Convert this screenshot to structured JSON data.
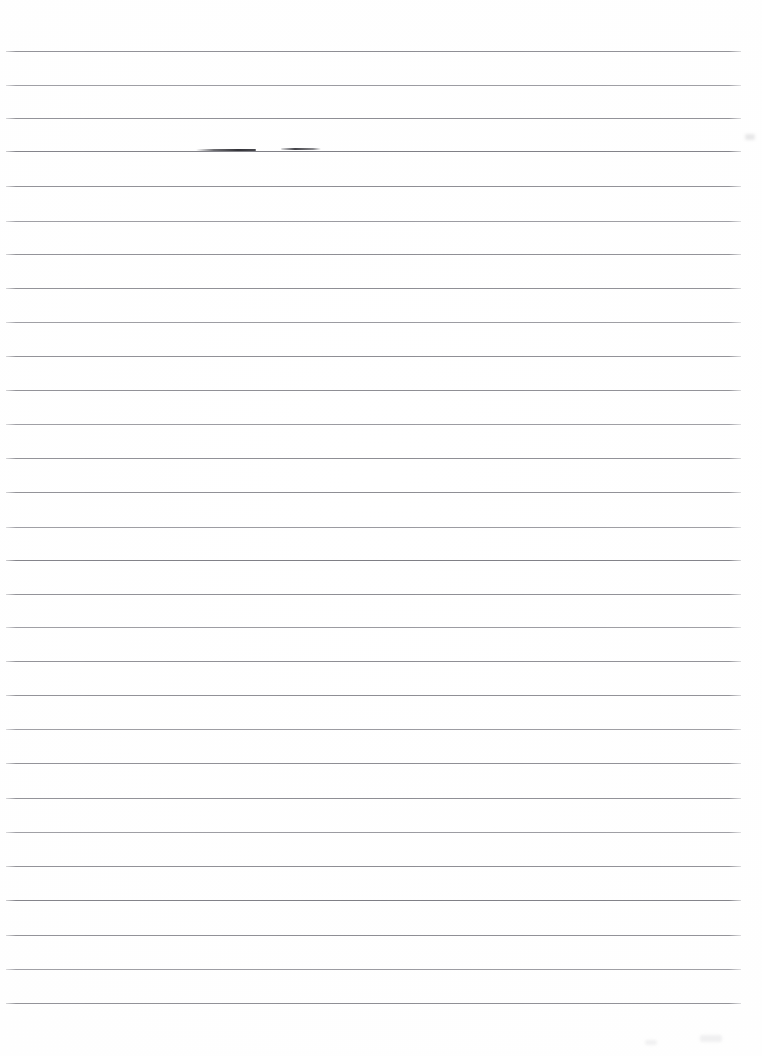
{
  "document": {
    "kind": "scanned-ruled-paper",
    "title": "Blank lined notebook page (scan)",
    "page_width": 762,
    "page_height": 1056,
    "orientation": "portrait",
    "background_color": "#fefefe",
    "rule_color": "#8e8e94",
    "ink_color": "#2e2e34",
    "visible_text": "",
    "content_note": "No text or writing is present on the page."
  },
  "ruling": {
    "line_count": 29,
    "first_line_y": 51,
    "spacing_px": 33.8,
    "left_margin_x": 6,
    "right_edge_x": 741,
    "has_vertical_margin_rule": false,
    "has_page_border": false,
    "lines": [
      {
        "y": 51,
        "x1": 6,
        "x2": 741,
        "weight": "normal"
      },
      {
        "y": 85,
        "x1": 6,
        "x2": 741,
        "weight": "soft"
      },
      {
        "y": 118,
        "x1": 6,
        "x2": 741,
        "weight": "normal"
      },
      {
        "y": 151,
        "x1": 6,
        "x2": 741,
        "weight": "dark"
      },
      {
        "y": 186,
        "x1": 6,
        "x2": 741,
        "weight": "normal"
      },
      {
        "y": 221,
        "x1": 6,
        "x2": 741,
        "weight": "soft"
      },
      {
        "y": 254,
        "x1": 6,
        "x2": 741,
        "weight": "normal"
      },
      {
        "y": 288,
        "x1": 6,
        "x2": 741,
        "weight": "normal"
      },
      {
        "y": 322,
        "x1": 6,
        "x2": 741,
        "weight": "soft"
      },
      {
        "y": 356,
        "x1": 6,
        "x2": 741,
        "weight": "normal"
      },
      {
        "y": 390,
        "x1": 6,
        "x2": 741,
        "weight": "normal"
      },
      {
        "y": 424,
        "x1": 6,
        "x2": 741,
        "weight": "soft"
      },
      {
        "y": 458,
        "x1": 6,
        "x2": 741,
        "weight": "normal"
      },
      {
        "y": 492,
        "x1": 6,
        "x2": 741,
        "weight": "normal"
      },
      {
        "y": 527,
        "x1": 6,
        "x2": 741,
        "weight": "soft"
      },
      {
        "y": 560,
        "x1": 6,
        "x2": 741,
        "weight": "dark"
      },
      {
        "y": 594,
        "x1": 6,
        "x2": 741,
        "weight": "normal"
      },
      {
        "y": 627,
        "x1": 6,
        "x2": 741,
        "weight": "soft"
      },
      {
        "y": 661,
        "x1": 6,
        "x2": 741,
        "weight": "normal"
      },
      {
        "y": 695,
        "x1": 6,
        "x2": 741,
        "weight": "normal"
      },
      {
        "y": 729,
        "x1": 6,
        "x2": 741,
        "weight": "soft"
      },
      {
        "y": 763,
        "x1": 6,
        "x2": 741,
        "weight": "normal"
      },
      {
        "y": 798,
        "x1": 6,
        "x2": 741,
        "weight": "normal"
      },
      {
        "y": 832,
        "x1": 6,
        "x2": 741,
        "weight": "soft"
      },
      {
        "y": 866,
        "x1": 6,
        "x2": 741,
        "weight": "normal"
      },
      {
        "y": 900,
        "x1": 6,
        "x2": 741,
        "weight": "dark"
      },
      {
        "y": 935,
        "x1": 6,
        "x2": 741,
        "weight": "normal"
      },
      {
        "y": 969,
        "x1": 6,
        "x2": 741,
        "weight": "soft"
      },
      {
        "y": 1003,
        "x1": 6,
        "x2": 741,
        "weight": "normal"
      }
    ]
  },
  "marks": {
    "ink_strokes": [
      {
        "name": "stroke-left",
        "x": 196,
        "y": 149,
        "width": 60,
        "height": 2
      },
      {
        "name": "stroke-right",
        "x": 281,
        "y": 148,
        "width": 40,
        "height": 2
      }
    ],
    "smudges": [
      {
        "name": "smudge-right-upper",
        "x": 745,
        "y": 134,
        "width": 10,
        "height": 6,
        "faint": false
      },
      {
        "name": "smudge-bottom-right",
        "x": 700,
        "y": 1035,
        "width": 22,
        "height": 7,
        "faint": true
      },
      {
        "name": "smudge-bottom-far-right",
        "x": 645,
        "y": 1040,
        "width": 12,
        "height": 5,
        "faint": true
      }
    ]
  }
}
